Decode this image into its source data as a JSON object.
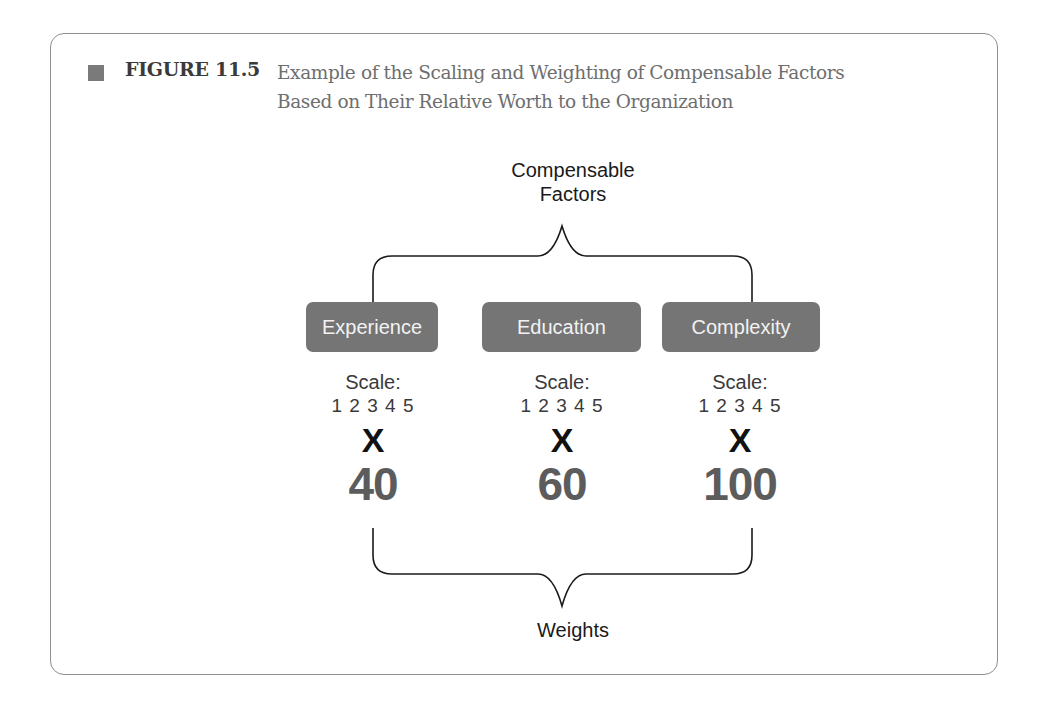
{
  "figure": {
    "number": "FIGURE 11.5",
    "caption_line1": "Example of the Scaling and Weighting of Compensable Factors",
    "caption_line2": "Based on Their Relative Worth to the Organization"
  },
  "diagram": {
    "top_label_line1": "Compensable",
    "top_label_line2": "Factors",
    "bottom_label": "Weights",
    "factors": [
      {
        "name": "Experience",
        "scale_label": "Scale:",
        "scale_values": "1 2 3 4 5",
        "operator": "X",
        "weight": "40"
      },
      {
        "name": "Education",
        "scale_label": "Scale:",
        "scale_values": "1 2 3 4 5",
        "operator": "X",
        "weight": "60"
      },
      {
        "name": "Complexity",
        "scale_label": "Scale:",
        "scale_values": "1 2 3 4 5",
        "operator": "X",
        "weight": "100"
      }
    ],
    "colors": {
      "box_fill": "#757575",
      "box_text": "#f2f2f2",
      "weight_text": "#5c5c5c",
      "brace_stroke": "#1a1a1a",
      "frame_border": "#8f8f8f"
    }
  }
}
